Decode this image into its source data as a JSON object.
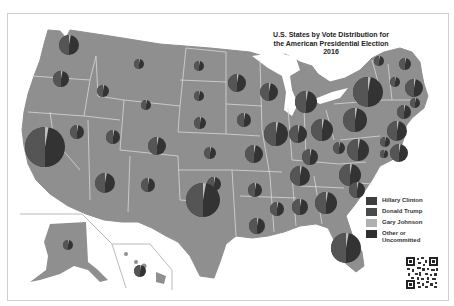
{
  "title": {
    "line1": "U.S. States by Vote Distribution for",
    "line2": "the American Presidential Election",
    "line3": "2016"
  },
  "legend": {
    "items": [
      {
        "label": "Hillary Clinton",
        "color": "#3d3d3d"
      },
      {
        "label": "Donald Trump",
        "color": "#4a4a4a"
      },
      {
        "label": "Gary Johnson",
        "color": "#b0b0b0"
      },
      {
        "label": "Other or",
        "label2": "Uncommitted",
        "color": "#2e2e2e"
      }
    ]
  },
  "colors": {
    "land": "#8f8f8f",
    "border": "#d8d8d8",
    "pie": "#333333",
    "pie_slice": "#555555",
    "johnson": "#bdbdbd",
    "water": "#ffffff"
  },
  "pies": [
    {
      "state": "WA",
      "x": 69,
      "y": 45,
      "r": 10
    },
    {
      "state": "OR",
      "x": 61,
      "y": 79,
      "r": 8
    },
    {
      "state": "ID",
      "x": 103,
      "y": 91,
      "r": 6
    },
    {
      "state": "MT",
      "x": 139,
      "y": 64,
      "r": 5
    },
    {
      "state": "ND",
      "x": 199,
      "y": 66,
      "r": 5
    },
    {
      "state": "MN",
      "x": 237,
      "y": 83,
      "r": 9
    },
    {
      "state": "WI",
      "x": 269,
      "y": 92,
      "r": 9
    },
    {
      "state": "MI",
      "x": 306,
      "y": 102,
      "r": 11
    },
    {
      "state": "SD",
      "x": 199,
      "y": 96,
      "r": 5
    },
    {
      "state": "WY",
      "x": 146,
      "y": 105,
      "r": 5
    },
    {
      "state": "NV",
      "x": 77,
      "y": 132,
      "r": 7
    },
    {
      "state": "UT",
      "x": 113,
      "y": 137,
      "r": 7
    },
    {
      "state": "CA",
      "x": 45,
      "y": 147,
      "r": 20
    },
    {
      "state": "CO",
      "x": 157,
      "y": 146,
      "r": 9
    },
    {
      "state": "NE",
      "x": 200,
      "y": 123,
      "r": 6
    },
    {
      "state": "IA",
      "x": 244,
      "y": 120,
      "r": 7
    },
    {
      "state": "IL",
      "x": 276,
      "y": 134,
      "r": 12
    },
    {
      "state": "IN",
      "x": 298,
      "y": 134,
      "r": 9
    },
    {
      "state": "OH",
      "x": 322,
      "y": 130,
      "r": 11
    },
    {
      "state": "PA",
      "x": 355,
      "y": 120,
      "r": 12
    },
    {
      "state": "NY",
      "x": 368,
      "y": 92,
      "r": 15
    },
    {
      "state": "KS",
      "x": 210,
      "y": 153,
      "r": 6
    },
    {
      "state": "MO",
      "x": 254,
      "y": 154,
      "r": 9
    },
    {
      "state": "KY",
      "x": 310,
      "y": 157,
      "r": 8
    },
    {
      "state": "WV",
      "x": 339,
      "y": 148,
      "r": 6
    },
    {
      "state": "VA",
      "x": 358,
      "y": 150,
      "r": 11
    },
    {
      "state": "AZ",
      "x": 105,
      "y": 183,
      "r": 10
    },
    {
      "state": "NM",
      "x": 148,
      "y": 185,
      "r": 7
    },
    {
      "state": "OK",
      "x": 214,
      "y": 184,
      "r": 7
    },
    {
      "state": "AR",
      "x": 255,
      "y": 190,
      "r": 7
    },
    {
      "state": "TN",
      "x": 300,
      "y": 176,
      "r": 10
    },
    {
      "state": "NC",
      "x": 350,
      "y": 175,
      "r": 11
    },
    {
      "state": "TX",
      "x": 203,
      "y": 200,
      "r": 17
    },
    {
      "state": "MS",
      "x": 277,
      "y": 209,
      "r": 7
    },
    {
      "state": "AL",
      "x": 300,
      "y": 207,
      "r": 8
    },
    {
      "state": "GA",
      "x": 326,
      "y": 203,
      "r": 11
    },
    {
      "state": "SC",
      "x": 357,
      "y": 190,
      "r": 8
    },
    {
      "state": "LA",
      "x": 257,
      "y": 226,
      "r": 8
    },
    {
      "state": "FL",
      "x": 346,
      "y": 248,
      "r": 15
    },
    {
      "state": "ME",
      "x": 405,
      "y": 64,
      "r": 6
    },
    {
      "state": "VT",
      "x": 379,
      "y": 61,
      "r": 5
    },
    {
      "state": "NH",
      "x": 395,
      "y": 82,
      "r": 5
    },
    {
      "state": "MA",
      "x": 414,
      "y": 88,
      "r": 9
    },
    {
      "state": "RI",
      "x": 415,
      "y": 103,
      "r": 5
    },
    {
      "state": "CT",
      "x": 404,
      "y": 112,
      "r": 7
    },
    {
      "state": "NJ",
      "x": 397,
      "y": 131,
      "r": 10
    },
    {
      "state": "DE",
      "x": 385,
      "y": 142,
      "r": 5
    },
    {
      "state": "MD",
      "x": 399,
      "y": 153,
      "r": 9
    },
    {
      "state": "DC",
      "x": 384,
      "y": 154,
      "r": 4
    },
    {
      "state": "AK",
      "x": 68,
      "y": 245,
      "r": 5
    },
    {
      "state": "HI",
      "x": 140,
      "y": 271,
      "r": 6
    }
  ]
}
